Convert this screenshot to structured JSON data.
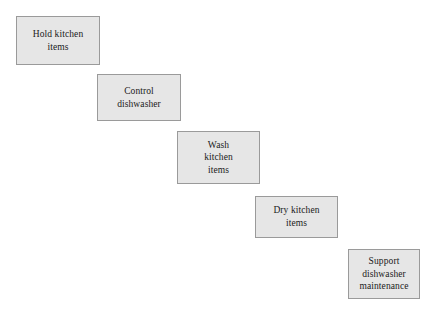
{
  "diagram": {
    "background_color": "#ffffff",
    "node_fill_color": "#e6e6e6",
    "node_border_color": "#9a9a9a",
    "text_color": "#1a1a1a",
    "nodes": [
      {
        "id": "hold-kitchen-items",
        "label": "Hold kitchen\nitems",
        "text_lines": [
          "Hold kitchen",
          "items"
        ],
        "x": 16,
        "y": 16,
        "width": 84,
        "height": 49
      },
      {
        "id": "control-dishwasher",
        "label": "Control\ndishwasher",
        "text_lines": [
          "Control",
          "dishwasher"
        ],
        "x": 97,
        "y": 74,
        "width": 84,
        "height": 47
      },
      {
        "id": "wash-kitchen-items",
        "label": "Wash\nkitchen\nitems",
        "text_lines": [
          "Wash",
          "kitchen",
          "items"
        ],
        "x": 177,
        "y": 131,
        "width": 83,
        "height": 53
      },
      {
        "id": "dry-kitchen-items",
        "label": "Dry kitchen\nitems",
        "text_lines": [
          "Dry kitchen",
          "items"
        ],
        "x": 255,
        "y": 196,
        "width": 83,
        "height": 42
      },
      {
        "id": "support-dishwasher-maintenance",
        "label": "Support\ndishwasher\nmaintenance",
        "text_lines": [
          "Support",
          "dishwasher",
          "maintenance"
        ],
        "x": 348,
        "y": 249,
        "width": 72,
        "height": 50
      }
    ]
  }
}
